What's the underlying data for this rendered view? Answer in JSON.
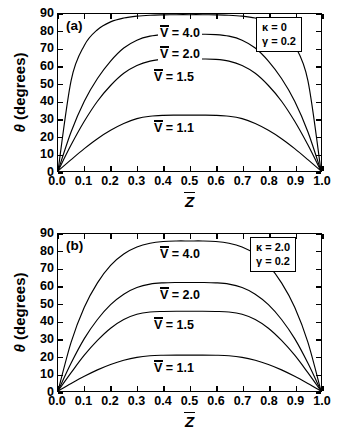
{
  "figure": {
    "axis": {
      "ylabel_theta": "θ",
      "ylabel_units": "(degrees)",
      "xlabel_symbol": "Z",
      "yticks": [
        "90",
        "80",
        "70",
        "60",
        "50",
        "40",
        "30",
        "20",
        "10",
        "0"
      ],
      "xticks": [
        "0.0",
        "0.1",
        "0.2",
        "0.3",
        "0.4",
        "0.5",
        "0.6",
        "0.7",
        "0.8",
        "0.9",
        "1.0"
      ]
    },
    "panels": [
      {
        "tag": "(a)",
        "legend": [
          {
            "symbol": "κ",
            "eq": "=",
            "value": "0"
          },
          {
            "symbol": "γ",
            "eq": "=",
            "value": "0.2"
          }
        ],
        "curve_labels": [
          {
            "symbol": "V",
            "eq": "= 4.0"
          },
          {
            "symbol": "V",
            "eq": "= 2.0"
          },
          {
            "symbol": "V",
            "eq": "= 1.5"
          },
          {
            "symbol": "V",
            "eq": "= 1.1"
          }
        ]
      },
      {
        "tag": "(b)",
        "legend": [
          {
            "symbol": "κ",
            "eq": "=",
            "value": "2.0"
          },
          {
            "symbol": "γ",
            "eq": "=",
            "value": "0.2"
          }
        ],
        "curve_labels": [
          {
            "symbol": "V",
            "eq": "= 4.0"
          },
          {
            "symbol": "V",
            "eq": "= 2.0"
          },
          {
            "symbol": "V",
            "eq": "= 1.5"
          },
          {
            "symbol": "V",
            "eq": "= 1.1"
          }
        ]
      }
    ]
  },
  "chart_data": [
    {
      "type": "line",
      "title": "(a)",
      "xlabel": "Z̄",
      "ylabel": "θ (degrees)",
      "xlim": [
        0.0,
        1.0
      ],
      "ylim": [
        0,
        90
      ],
      "xticks": [
        0.0,
        0.1,
        0.2,
        0.3,
        0.4,
        0.5,
        0.6,
        0.7,
        0.8,
        0.9,
        1.0
      ],
      "yticks": [
        0,
        10,
        20,
        30,
        40,
        50,
        60,
        70,
        80,
        90
      ],
      "grid": false,
      "legend_position": "top-right-box",
      "annotations": [
        "κ = 0",
        "γ = 0.2"
      ],
      "x": [
        0.0,
        0.05,
        0.1,
        0.15,
        0.2,
        0.25,
        0.3,
        0.35,
        0.4,
        0.45,
        0.5,
        0.55,
        0.6,
        0.65,
        0.7,
        0.75,
        0.8,
        0.85,
        0.9,
        0.95,
        1.0
      ],
      "series": [
        {
          "name": "V̄ = 4.0",
          "values": [
            0,
            52,
            72,
            81,
            85.5,
            87.7,
            88.8,
            89.3,
            89.5,
            89.6,
            89.6,
            89.6,
            89.5,
            89.3,
            88.8,
            87.7,
            85.5,
            81,
            72,
            52,
            0
          ]
        },
        {
          "name": "V̄ = 2.0",
          "values": [
            0,
            22.5,
            40,
            53,
            63,
            70.5,
            75,
            77.3,
            78.2,
            78.4,
            78.4,
            78.4,
            78.2,
            77.3,
            75,
            70.5,
            63,
            53,
            40,
            22.5,
            0
          ]
        },
        {
          "name": "V̄ = 1.5",
          "values": [
            0,
            15,
            28.5,
            40,
            49,
            56,
            60.5,
            63,
            64,
            64.2,
            64.2,
            64.2,
            64,
            63,
            60.5,
            56,
            49,
            40,
            28.5,
            15,
            0
          ]
        },
        {
          "name": "V̄ = 1.1",
          "values": [
            0,
            6.5,
            12.8,
            18.5,
            23.3,
            27.2,
            30,
            31.4,
            31.9,
            32,
            32,
            32,
            31.9,
            31.4,
            30,
            27.2,
            23.3,
            18.5,
            12.8,
            6.5,
            0
          ]
        }
      ]
    },
    {
      "type": "line",
      "title": "(b)",
      "xlabel": "Z̄",
      "ylabel": "θ (degrees)",
      "xlim": [
        0.0,
        1.0
      ],
      "ylim": [
        0,
        90
      ],
      "xticks": [
        0.0,
        0.1,
        0.2,
        0.3,
        0.4,
        0.5,
        0.6,
        0.7,
        0.8,
        0.9,
        1.0
      ],
      "yticks": [
        0,
        10,
        20,
        30,
        40,
        50,
        60,
        70,
        80,
        90
      ],
      "grid": false,
      "legend_position": "top-right-box",
      "annotations": [
        "κ = 2.0",
        "γ = 0.2"
      ],
      "x": [
        0.0,
        0.05,
        0.1,
        0.15,
        0.2,
        0.25,
        0.3,
        0.35,
        0.4,
        0.45,
        0.5,
        0.55,
        0.6,
        0.65,
        0.7,
        0.75,
        0.8,
        0.85,
        0.9,
        0.95,
        1.0
      ],
      "series": [
        {
          "name": "V̄ = 4.0",
          "values": [
            0,
            28,
            48,
            62,
            72,
            78.5,
            82.5,
            84.7,
            85.7,
            86,
            86,
            86,
            85.7,
            84.7,
            82.5,
            78.5,
            72,
            62,
            48,
            28,
            0
          ]
        },
        {
          "name": "V̄ = 2.0",
          "values": [
            0,
            16,
            30,
            41,
            49.5,
            55.5,
            59.3,
            61.3,
            62,
            62.2,
            62.2,
            62.2,
            62,
            61.3,
            59.3,
            55.5,
            49.5,
            41,
            30,
            16,
            0
          ]
        },
        {
          "name": "V̄ = 1.5",
          "values": [
            0,
            10.5,
            20.5,
            29,
            36,
            41,
            44,
            45.3,
            45.6,
            45.7,
            45.7,
            45.7,
            45.6,
            45.3,
            44,
            41,
            36,
            29,
            20.5,
            10.5,
            0
          ]
        },
        {
          "name": "V̄ = 1.1",
          "values": [
            0,
            4.3,
            8.4,
            12.1,
            15.2,
            17.6,
            19.3,
            20.2,
            20.5,
            20.6,
            20.6,
            20.6,
            20.5,
            20.2,
            19.3,
            17.6,
            15.2,
            12.1,
            8.4,
            4.3,
            0
          ]
        }
      ]
    }
  ]
}
